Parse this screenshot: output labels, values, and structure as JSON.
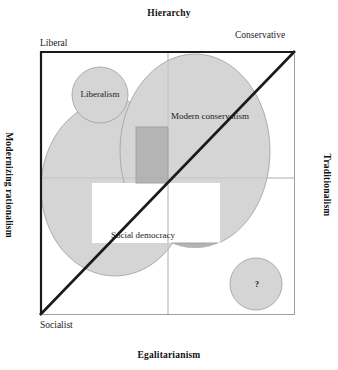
{
  "diagram": {
    "title_axes": {
      "top": "Hierarchy",
      "bottom": "Egalitarianism",
      "left": "Modernizing rationalism",
      "right": "Traditionalism"
    },
    "poles": {
      "top_left": "Liberal",
      "top_right": "Conservative",
      "bottom_left": "Socialist"
    },
    "regions": [
      {
        "id": "liberalism",
        "label": "Liberalism",
        "shape": "circle",
        "quadrant": "top-left"
      },
      {
        "id": "modern-conservatism",
        "label": "Modern conservatism",
        "shape": "ellipse",
        "quadrant": "top-right"
      },
      {
        "id": "social-democracy",
        "label": "Social democracy",
        "shape": "ellipse",
        "quadrant": "bottom-left"
      },
      {
        "id": "unknown",
        "label": "?",
        "shape": "circle",
        "quadrant": "bottom-right"
      }
    ],
    "colors": {
      "fill": "#d4d4d4",
      "fill_overlap": "#b5b5b5",
      "outline": "#9a9a9a",
      "frame": "#9e9e9e",
      "frame_heavy": "#1a1a1a",
      "gridline": "#c9c9c9",
      "diagonal": "#1a1a1a",
      "text": "#1a1a1a",
      "background": "#ffffff"
    },
    "diagonal": {
      "from": "bottom-left",
      "to": "top-right"
    },
    "gridlines": {
      "vertical_x_fraction": 0.5,
      "horizontal_y_fraction": 0.48
    }
  }
}
